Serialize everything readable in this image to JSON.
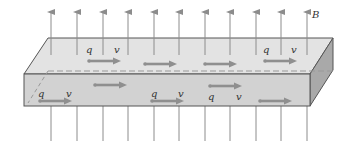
{
  "figure": {
    "field_label": "B",
    "charge_label": "q",
    "velocity_label": "v"
  },
  "colors": {
    "field_line": "#8c8c8c",
    "slab_top": "#e3e3e3",
    "slab_front": "#d2d2d2",
    "slab_side": "#a9a9a9",
    "edge": "#555555",
    "arrow": "#8f8f8f",
    "text": "#333333"
  },
  "field_lines_x": [
    51,
    77,
    103,
    128,
    154,
    179,
    205,
    230,
    256,
    281,
    307
  ],
  "top_row_arrows": [
    {
      "x": 89,
      "y": 61,
      "labeled": true,
      "q_x": 86,
      "v_x": 114,
      "label_y": 53
    },
    {
      "x": 145,
      "y": 64,
      "labeled": false
    },
    {
      "x": 205,
      "y": 64,
      "labeled": false
    },
    {
      "x": 265,
      "y": 61,
      "labeled": true,
      "q_x": 263,
      "v_x": 291,
      "label_y": 53
    }
  ],
  "front_row_arrows": [
    {
      "x": 40,
      "y": 101,
      "labeled": true,
      "q_x": 38,
      "v_x": 66,
      "label_y": 97
    },
    {
      "x": 95,
      "y": 85,
      "labeled": false
    },
    {
      "x": 152,
      "y": 101,
      "labeled": true,
      "q_x": 151,
      "v_x": 178,
      "label_y": 97
    },
    {
      "x": 210,
      "y": 86,
      "labeled": true,
      "q_x": 208,
      "v_x": 236,
      "label_y": 100
    },
    {
      "x": 260,
      "y": 101,
      "labeled": false
    }
  ]
}
